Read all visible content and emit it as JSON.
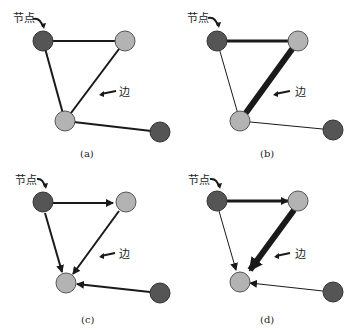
{
  "panels": [
    {
      "id": "a",
      "caption": "(a)",
      "node_label": "节点",
      "edge_label": "边",
      "type": "undirected-unweighted"
    },
    {
      "id": "b",
      "caption": "(b)",
      "node_label": "节点",
      "edge_label": "边",
      "type": "undirected-weighted"
    },
    {
      "id": "c",
      "caption": "(c)",
      "node_label": "节点",
      "edge_label": "边",
      "type": "directed-unweighted"
    },
    {
      "id": "d",
      "caption": "(d)",
      "node_label": "节点",
      "edge_label": "边",
      "type": "directed-weighted"
    }
  ],
  "colors": {
    "dark_node": "#555555",
    "light_node": "#b3b3b3",
    "edge": "#1a1a1a"
  }
}
